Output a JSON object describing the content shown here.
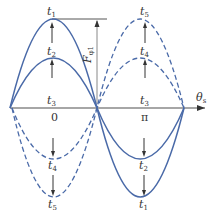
{
  "colors": {
    "curve": "#4a6aa8",
    "axis": "#888888",
    "text": "#333333",
    "background": "#ffffff"
  },
  "labels": {
    "t1_top_left": {
      "main": "t",
      "sub": "1"
    },
    "t2_top_left": {
      "main": "t",
      "sub": "2"
    },
    "t3_left": {
      "main": "t",
      "sub": "3"
    },
    "t4_bottom_left": {
      "main": "t",
      "sub": "4"
    },
    "t5_bottom_left": {
      "main": "t",
      "sub": "5"
    },
    "t5_top_right": {
      "main": "t",
      "sub": "5"
    },
    "t4_top_right": {
      "main": "t",
      "sub": "4"
    },
    "t3_right": {
      "main": "t",
      "sub": "3"
    },
    "t2_bottom_right": {
      "main": "t",
      "sub": "2"
    },
    "t1_bottom_right": {
      "main": "t",
      "sub": "1"
    },
    "origin": "0",
    "pi": "π",
    "x_axis": {
      "main": "θ",
      "sub": "s"
    },
    "amplitude": {
      "main": "F",
      "sub": "φ1"
    }
  },
  "curves": [
    {
      "name": "t1",
      "style": "solid",
      "amplitude": 1.0
    },
    {
      "name": "t2",
      "style": "solid",
      "amplitude": 0.62
    },
    {
      "name": "t4",
      "style": "dashed",
      "amplitude": 0.62
    },
    {
      "name": "t5",
      "style": "dashed",
      "amplitude": 1.0
    }
  ]
}
